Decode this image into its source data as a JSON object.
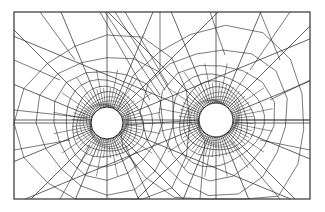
{
  "figure": {
    "type": "finite-element-mesh",
    "frame": {
      "x": 14,
      "y": 12,
      "width": 296,
      "height": 187
    },
    "holes": [
      {
        "name": "left-hole",
        "cx": 107,
        "cy": 123,
        "r": 16
      },
      {
        "name": "right-hole",
        "cx": 216,
        "cy": 120,
        "r": 17
      }
    ],
    "colors": {
      "line": "#222222",
      "background": "#ffffff"
    }
  }
}
